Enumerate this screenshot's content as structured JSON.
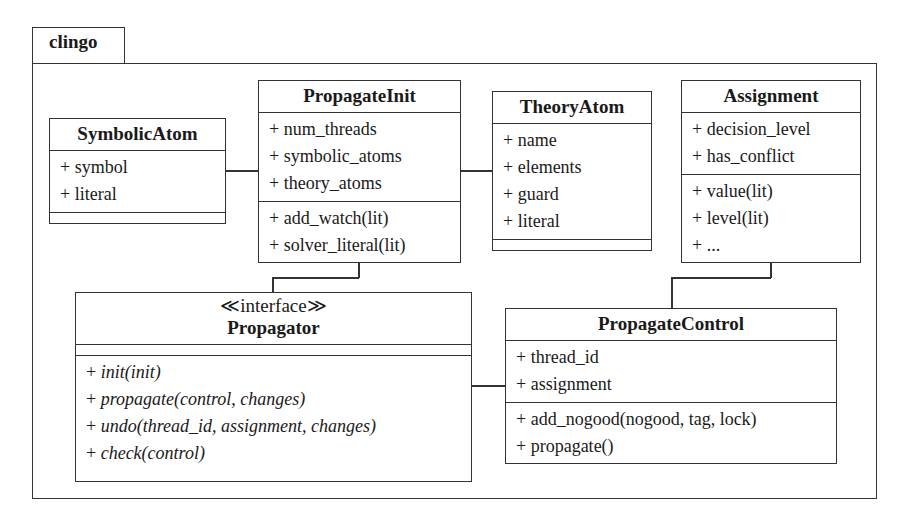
{
  "package": {
    "name": "clingo"
  },
  "classes": {
    "symbolic_atom": {
      "name": "SymbolicAtom",
      "attributes": [
        "+ symbol",
        "+ literal"
      ],
      "methods": []
    },
    "propagate_init": {
      "name": "PropagateInit",
      "attributes": [
        "+ num_threads",
        "+ symbolic_atoms",
        "+ theory_atoms"
      ],
      "methods": [
        "+ add_watch(lit)",
        "+ solver_literal(lit)"
      ]
    },
    "theory_atom": {
      "name": "TheoryAtom",
      "attributes": [
        "+ name",
        "+ elements",
        "+ guard",
        "+ literal"
      ],
      "methods": []
    },
    "assignment": {
      "name": "Assignment",
      "attributes": [
        "+ decision_level",
        "+ has_conflict"
      ],
      "methods": [
        "+ value(lit)",
        "+ level(lit)",
        "+ ..."
      ]
    },
    "propagator": {
      "stereotype": "≪interface≫",
      "name": "Propagator",
      "attributes": [],
      "methods": [
        "+ ",
        "+ ",
        "+ ",
        "+ "
      ],
      "method_names": [
        "init(init)",
        "propagate(control, changes)",
        "undo(thread_id, assignment, changes)",
        "check(control)"
      ]
    },
    "propagate_control": {
      "name": "PropagateControl",
      "attributes": [
        "+ thread_id",
        "+ assignment"
      ],
      "methods": [
        "+ add_nogood(nogood, tag, lock)",
        "+ propagate()"
      ]
    }
  },
  "associations": [
    {
      "from": "SymbolicAtom",
      "to": "PropagateInit"
    },
    {
      "from": "PropagateInit",
      "to": "TheoryAtom"
    },
    {
      "from": "PropagateInit",
      "to": "Propagator"
    },
    {
      "from": "Propagator",
      "to": "PropagateControl"
    },
    {
      "from": "Assignment",
      "to": "PropagateControl"
    }
  ]
}
